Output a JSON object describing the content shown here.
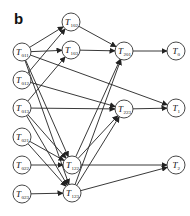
{
  "panel_label": "b",
  "nodes": [
    {
      "id": "T011",
      "base": "T",
      "sub": "011",
      "x": 22,
      "y": 52
    },
    {
      "id": "T012",
      "base": "T",
      "sub": "012",
      "x": 22,
      "y": 80
    },
    {
      "id": "T013",
      "base": "T",
      "sub": "013",
      "x": 22,
      "y": 108
    },
    {
      "id": "T021",
      "base": "T",
      "sub": "021",
      "x": 22,
      "y": 137
    },
    {
      "id": "T022",
      "base": "T",
      "sub": "022",
      "x": 22,
      "y": 165
    },
    {
      "id": "T023",
      "base": "T",
      "sub": "023",
      "x": 22,
      "y": 194
    },
    {
      "id": "T102",
      "base": "T",
      "sub": "102",
      "x": 71,
      "y": 22
    },
    {
      "id": "T103",
      "base": "T",
      "sub": "103",
      "x": 71,
      "y": 50
    },
    {
      "id": "T122",
      "base": "T",
      "sub": "122",
      "x": 72,
      "y": 165
    },
    {
      "id": "T123",
      "base": "T",
      "sub": "123",
      "x": 72,
      "y": 193
    },
    {
      "id": "T201",
      "base": "T",
      "sub": "201",
      "x": 124,
      "y": 51
    },
    {
      "id": "T223",
      "base": "T",
      "sub": "223",
      "x": 124,
      "y": 109
    },
    {
      "id": "T0",
      "base": "T",
      "sub": "0",
      "x": 176,
      "y": 51
    },
    {
      "id": "T1",
      "base": "T",
      "sub": "1",
      "x": 176,
      "y": 108
    },
    {
      "id": "T2",
      "base": "T",
      "sub": "2",
      "x": 176,
      "y": 165
    }
  ],
  "edges": [
    [
      "T011",
      "T102"
    ],
    [
      "T011",
      "T103"
    ],
    [
      "T011",
      "T1"
    ],
    [
      "T011",
      "T122"
    ],
    [
      "T011",
      "T123"
    ],
    [
      "T012",
      "T102"
    ],
    [
      "T012",
      "T223"
    ],
    [
      "T013",
      "T103"
    ],
    [
      "T013",
      "T223"
    ],
    [
      "T013",
      "T122"
    ],
    [
      "T013",
      "T123"
    ],
    [
      "T021",
      "T122"
    ],
    [
      "T021",
      "T123"
    ],
    [
      "T022",
      "T122"
    ],
    [
      "T023",
      "T123"
    ],
    [
      "T102",
      "T201"
    ],
    [
      "T103",
      "T201"
    ],
    [
      "T122",
      "T201"
    ],
    [
      "T123",
      "T201"
    ],
    [
      "T122",
      "T223"
    ],
    [
      "T123",
      "T223"
    ],
    [
      "T201",
      "T0"
    ],
    [
      "T223",
      "T1"
    ],
    [
      "T122",
      "T2"
    ],
    [
      "T123",
      "T2"
    ]
  ],
  "node_radius": 9
}
